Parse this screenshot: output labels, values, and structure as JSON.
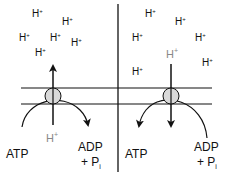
{
  "diagram": {
    "colors": {
      "line": "#111111",
      "text": "#111111",
      "text_muted": "#888888",
      "channel_fill": "#d9d9d9"
    },
    "left_panel": {
      "proton_labels": [
        "H+",
        "H+",
        "H+",
        "H+",
        "H+",
        "H+"
      ],
      "proton_base": "H",
      "proton_sup": "+",
      "translocated_proton": {
        "base": "H",
        "sup": "+"
      },
      "reactant": "ATP",
      "product_line1": "ADP",
      "product_line2_prefix": "+ P",
      "product_line2_sub": "i",
      "proton_arrow_direction": "up",
      "reaction_arrow": "ATP → ADP + Pi"
    },
    "right_panel": {
      "proton_labels": [
        "H+",
        "H+",
        "H+",
        "H+",
        "H+",
        "H+"
      ],
      "proton_base": "H",
      "proton_sup": "+",
      "translocated_proton": {
        "base": "H",
        "sup": "+"
      },
      "product": "ATP",
      "reactant_line1": "ADP",
      "reactant_line2_prefix": "+ P",
      "reactant_line2_sub": "i",
      "proton_arrow_direction": "down",
      "reaction_arrow": "ADP + Pi → ATP"
    }
  }
}
